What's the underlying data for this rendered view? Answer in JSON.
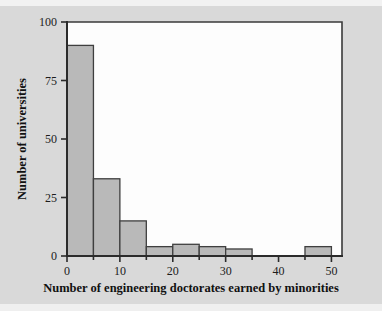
{
  "figure": {
    "background_color": "#d9d9d9",
    "plot_background_color": "#fdfdfd",
    "bar_fill_color": "#b9b9b9",
    "bar_edge_color": "#3f3f3f",
    "axis_color": "#2b2b2b"
  },
  "chart_data": {
    "type": "bar",
    "title": "",
    "subtitle": "",
    "xlabel": "Number of engineering doctorates earned by minorities",
    "ylabel": "Number of universities",
    "xlim": [
      0,
      52
    ],
    "ylim": [
      0,
      100
    ],
    "xticks": [
      0,
      10,
      20,
      30,
      40,
      50
    ],
    "xtick_labels": [
      "0",
      "10",
      "20",
      "30",
      "40",
      "50"
    ],
    "xminor_ticks": [
      5,
      15,
      25,
      35,
      45
    ],
    "yticks": [
      0,
      25,
      50,
      75,
      100
    ],
    "ytick_labels": [
      "0",
      "25",
      "50",
      "75",
      "100"
    ],
    "grid": false,
    "legend": null,
    "bin_width": 5,
    "bin_edges": [
      0,
      5,
      10,
      15,
      20,
      25,
      30,
      35,
      40,
      45,
      50
    ],
    "categories": [
      "0-5",
      "5-10",
      "10-15",
      "15-20",
      "20-25",
      "25-30",
      "30-35",
      "35-40",
      "40-45",
      "45-50"
    ],
    "values": [
      90,
      33,
      15,
      4,
      5,
      4,
      3,
      0,
      0,
      4
    ],
    "annotations": []
  }
}
